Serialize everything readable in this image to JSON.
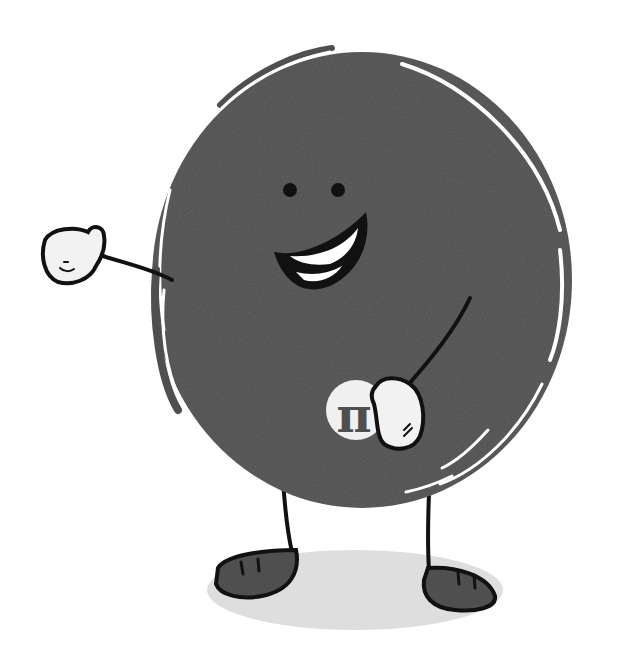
{
  "illustration": {
    "subject": "cartoon circle character waving and holding a pi badge",
    "badge_symbol": "π",
    "colors": {
      "background": "#ffffff",
      "body": "#4f4f4f",
      "outline": "#111111",
      "glove": "#f2f2f2",
      "badge": "#f0f0f0",
      "shadow": "#dedede",
      "shoe": "#4f4f4f"
    }
  }
}
